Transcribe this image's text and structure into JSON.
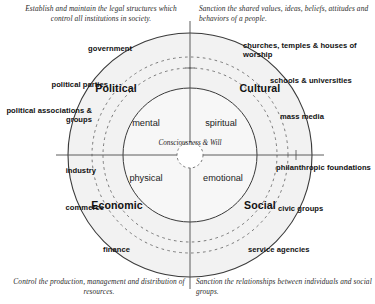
{
  "diagram": {
    "geometry": {
      "center_x": 190,
      "center_y": 155,
      "outer_radius": 122,
      "dashed_radius_outer": 98,
      "dashed_radius_inner": 87,
      "inner_radius": 67,
      "core_radius": 13,
      "axis_overshoot": 12
    },
    "colors": {
      "stroke": "#3a3a3a",
      "fill": "#f2f2f2",
      "text": "#111111",
      "caption": "#2b2b2b"
    }
  },
  "captions": {
    "top_left": "Establish and maintain the legal structures which control all institutions in society.",
    "top_right": "Sanction the shared values, ideas, beliefs, attitudes and behaviors of a people.",
    "bottom_left": "Control the production, management and distribution of resources.",
    "bottom_right": "Sanction the relationships between individuals and social groups."
  },
  "quadrants": {
    "political": "Political",
    "cultural": "Cultural",
    "economic": "Economic",
    "social": "Social"
  },
  "inner": {
    "mental": "mental",
    "spiritual": "spiritual",
    "physical": "physical",
    "emotional": "emotional",
    "core": "Consciousness & Will"
  },
  "institutions": {
    "left": [
      {
        "key": "government",
        "label": "government"
      },
      {
        "key": "political-parties",
        "label": "political parties"
      },
      {
        "key": "political-associations-groups",
        "label": "political associations & groups"
      },
      {
        "key": "industry",
        "label": "industry"
      },
      {
        "key": "commerce",
        "label": "commerce"
      },
      {
        "key": "finance",
        "label": "finance"
      }
    ],
    "right": [
      {
        "key": "churches-temples-houses-of-worship",
        "label": "churches, temples & houses of worship"
      },
      {
        "key": "schools-universities",
        "label": "schools & universities"
      },
      {
        "key": "mass-media",
        "label": "mass media"
      },
      {
        "key": "philanthropic-foundations",
        "label": "philanthropic foundations"
      },
      {
        "key": "civic-groups",
        "label": "civic groups"
      },
      {
        "key": "service-agencies",
        "label": "service agencies"
      }
    ]
  }
}
